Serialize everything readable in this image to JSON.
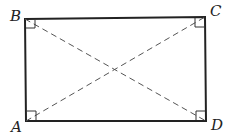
{
  "diagram": {
    "type": "rectangle-with-diagonals",
    "stroke_color": "#222222",
    "dash_color": "#555555",
    "vertices": [
      {
        "label": "A",
        "x": 26,
        "y": 121
      },
      {
        "label": "B",
        "x": 25,
        "y": 19
      },
      {
        "label": "C",
        "x": 205,
        "y": 17
      },
      {
        "label": "D",
        "x": 206,
        "y": 121
      }
    ],
    "labels": {
      "A": "A",
      "B": "B",
      "C": "C",
      "D": "D"
    },
    "diagonals": [
      "AC",
      "BD"
    ],
    "right_angle_marks": [
      "A",
      "B",
      "C",
      "D"
    ]
  }
}
